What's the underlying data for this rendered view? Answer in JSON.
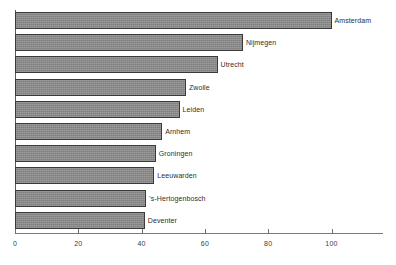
{
  "chart_data": {
    "type": "bar",
    "orientation": "horizontal",
    "title": "",
    "subtitle": "",
    "xlabel": "",
    "ylabel": "",
    "categories": [
      "Amsterdam",
      "Nijmegen",
      "Utrecht",
      "Zwolle",
      "Leiden",
      "Arnhem",
      "Groningen",
      "Leeuwarden",
      "'s-Hertogenbosch",
      "Deventer"
    ],
    "values": [
      100,
      72,
      64,
      54,
      52,
      46.5,
      44.5,
      44,
      41.5,
      41
    ],
    "xlim": [
      0,
      116
    ],
    "xticks": [
      0,
      20,
      40,
      60,
      80,
      100
    ],
    "xtick_labels": [
      "0",
      "20",
      "40",
      "60",
      "80",
      "100"
    ],
    "grid": false,
    "legend": null,
    "legend_position": "none",
    "annotations": [],
    "bar_fill_color": "#8a8a8a",
    "bar_border_color": "#3a3a3a",
    "axis_color": "#6e6e6e",
    "label_color": "#2e2e2e",
    "background_color": "#ffffff"
  }
}
